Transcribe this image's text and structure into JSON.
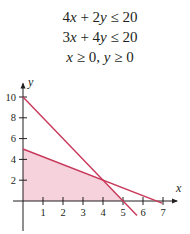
{
  "equations": [
    "4x + 2y ≤ 20",
    "3x + 4y ≤ 20",
    "x ≥ 0, y ≥ 0"
  ],
  "colors": {
    "line": "#c8385a",
    "fill": "#f6d3dc",
    "axis": "#231f20"
  },
  "chart_data": {
    "type": "line",
    "title": "",
    "xlabel": "x",
    "ylabel": "y",
    "xlim": [
      0,
      7
    ],
    "ylim": [
      0,
      10
    ],
    "x_ticks": [
      1,
      2,
      3,
      4,
      5,
      6,
      7
    ],
    "y_ticks": [
      2,
      4,
      6,
      8,
      10
    ],
    "grid": false,
    "series": [
      {
        "name": "4x + 2y = 20",
        "x": [
          0,
          5
        ],
        "y": [
          10,
          0
        ]
      },
      {
        "name": "3x + 4y = 20",
        "x": [
          0,
          6.667
        ],
        "y": [
          5,
          0
        ]
      }
    ],
    "feasible_region": {
      "vertices": [
        [
          0,
          0
        ],
        [
          0,
          5
        ],
        [
          4,
          2
        ],
        [
          5,
          0
        ]
      ],
      "shaded": true
    },
    "intersection": [
      4,
      2
    ]
  }
}
